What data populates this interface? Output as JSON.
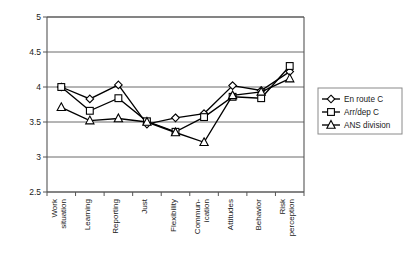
{
  "chart_data": {
    "type": "line",
    "title": "",
    "subtitle": "",
    "xlabel": "",
    "ylabel": "",
    "ylim": [
      2.5,
      5
    ],
    "ytick_labels": [
      "5",
      "4.5",
      "4",
      "3.5",
      "3",
      "2.5"
    ],
    "ytick_values": [
      5,
      4.5,
      4,
      3.5,
      3,
      2.5
    ],
    "grid": true,
    "legend_position": "right",
    "categories": [
      "Work situation",
      "Learning",
      "Reporting",
      "Just",
      "Flexibility",
      "Commun-ication",
      "Attitudes",
      "Behavior",
      "Risk perception"
    ],
    "category_lines": [
      [
        "Work",
        "situation"
      ],
      [
        "Learning"
      ],
      [
        "Reporting"
      ],
      [
        "Just"
      ],
      [
        "Flexibility"
      ],
      [
        "Commun-",
        "ication"
      ],
      [
        "Attitudes"
      ],
      [
        "Behavior"
      ],
      [
        "Risk",
        "perception"
      ]
    ],
    "series": [
      {
        "name": "En route C",
        "marker": "diamond",
        "values": [
          4.0,
          3.83,
          4.03,
          3.47,
          3.56,
          3.62,
          4.02,
          3.95,
          4.22
        ]
      },
      {
        "name": "Arr/dep C",
        "marker": "square",
        "values": [
          4.0,
          3.66,
          3.84,
          3.51,
          3.36,
          3.57,
          3.86,
          3.84,
          4.3
        ]
      },
      {
        "name": "ANS division",
        "marker": "triangle",
        "values": [
          3.71,
          3.52,
          3.55,
          3.5,
          3.35,
          3.21,
          3.88,
          3.93,
          4.12
        ]
      }
    ],
    "colors": {
      "line": "#000000",
      "marker_fill": "#ffffff",
      "grid": "#6b6b6b",
      "axis": "#555555",
      "background": "#ffffff"
    }
  },
  "legend": {
    "entries": [
      {
        "label": "En route C",
        "marker": "diamond"
      },
      {
        "label": "Arr/dep C",
        "marker": "square"
      },
      {
        "label": "ANS division",
        "marker": "triangle"
      }
    ]
  }
}
